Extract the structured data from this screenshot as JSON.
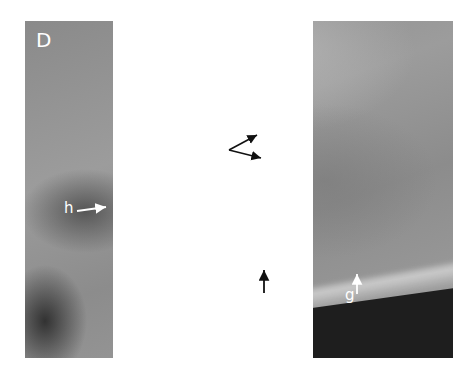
{
  "figure": {
    "panel_label": "D",
    "annotations": [
      {
        "id": "i",
        "label": "i",
        "arrows": 2
      },
      {
        "id": "h",
        "label": "h",
        "arrows": 1
      },
      {
        "id": "e",
        "label": "e",
        "arrows": 1
      },
      {
        "id": "g",
        "label": "g",
        "arrows": 1
      }
    ]
  },
  "colors": {
    "label": "#ffffff",
    "background": "#ffffff"
  }
}
